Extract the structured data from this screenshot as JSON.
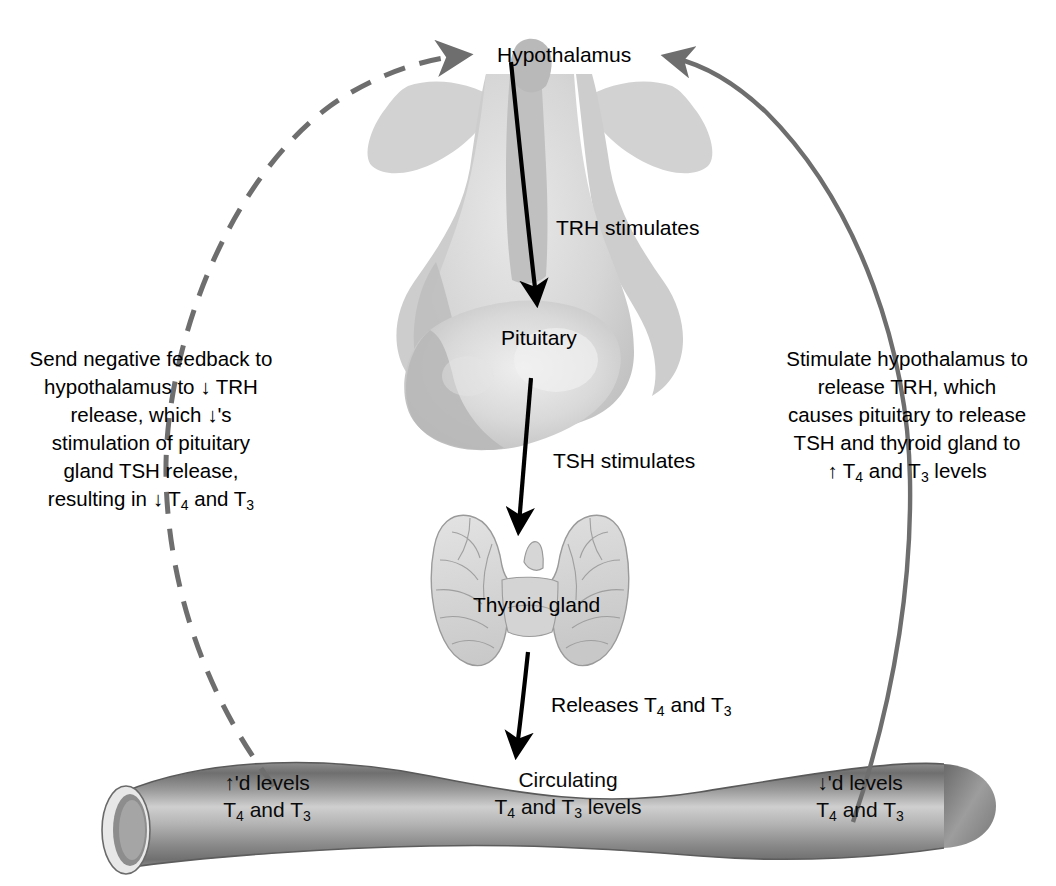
{
  "diagram": {
    "colors": {
      "gland_fill": "#d3d3d3",
      "gland_shadow": "#b5b5b5",
      "vessel_dark": "#6e6e6e",
      "vessel_light": "#d8d8d8",
      "feedback_arrow": "#6e6e6e",
      "stimulate_arrow": "#6e6e6e",
      "direct_arrow": "#000000",
      "text": "#000000",
      "background": "#ffffff"
    }
  },
  "labels": {
    "hypothalamus": "Hypothalamus",
    "trh_stimulates": "TRH stimulates",
    "pituitary": "Pituitary",
    "tsh_stimulates": "TSH stimulates",
    "thyroid_gland": "Thyroid gland",
    "releases": "Releases T4 and T3"
  },
  "side_text": {
    "left": {
      "name": "negative-feedback-description",
      "lines": [
        "Send negative feedback to",
        "hypothalamus to ↓ TRH",
        "release, which ↓'s",
        "stimulation of pituitary",
        "gland TSH release,",
        "resulting in ↓ T4 and T3"
      ]
    },
    "right": {
      "name": "positive-stimulation-description",
      "lines": [
        "Stimulate hypothalamus to",
        "release TRH, which",
        "causes pituitary to release",
        "TSH and thyroid gland to",
        "↑ T4 and T3 levels"
      ]
    }
  },
  "vessel": {
    "left_label": "↑'d levels\nT4 and T3",
    "center_label": "Circulating\nT4 and T3 levels",
    "right_label": "↓'d levels\nT4 and T3"
  },
  "arrows": {
    "trh": "TRH stimulates arrow from hypothalamus to pituitary",
    "tsh": "TSH stimulates arrow from pituitary to thyroid gland",
    "release": "Releases arrow from thyroid gland to bloodstream",
    "negative_feedback": "Dashed arrow from high hormone levels up to hypothalamus",
    "positive_stimulation": "Solid arrow from low hormone levels up to hypothalamus"
  }
}
